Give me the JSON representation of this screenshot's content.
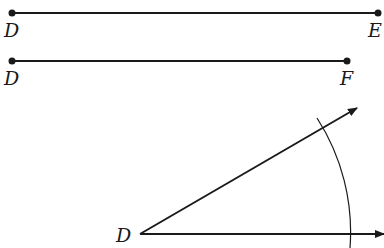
{
  "diagram": {
    "segment_de": {
      "start_label": "D",
      "end_label": "E"
    },
    "segment_df": {
      "start_label": "D",
      "end_label": "F"
    },
    "angle": {
      "vertex_label": "D"
    }
  },
  "colors": {
    "stroke": "#1a1a1a",
    "background": "#ffffff"
  }
}
